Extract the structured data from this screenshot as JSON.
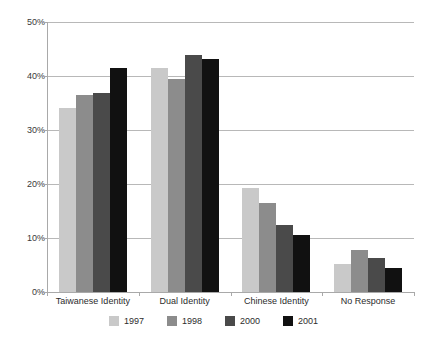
{
  "chart_data": {
    "type": "bar",
    "title": "",
    "subtitle": "",
    "xlabel": "",
    "ylabel": "",
    "ylim": [
      0,
      50
    ],
    "ytick_labels": [
      "50%",
      "40%",
      "30%",
      "20%",
      "10%",
      "0%"
    ],
    "ytick_values": [
      50,
      40,
      30,
      20,
      10,
      0
    ],
    "grid": true,
    "legend_position": "bottom",
    "categories": [
      "Taiwanese Identity",
      "Dual Identity",
      "Chinese Identity",
      "No Response"
    ],
    "series": [
      {
        "name": "1997",
        "color": "#c9c9c9",
        "values": [
          34.1,
          41.4,
          19.2,
          5.2
        ]
      },
      {
        "name": "1998",
        "color": "#8c8c8c",
        "values": [
          36.4,
          39.5,
          16.4,
          7.7
        ]
      },
      {
        "name": "2000",
        "color": "#4a4a4a",
        "values": [
          36.9,
          43.8,
          12.5,
          6.3
        ]
      },
      {
        "name": "2001",
        "color": "#111111",
        "values": [
          41.4,
          43.1,
          10.6,
          4.5
        ]
      }
    ]
  },
  "colors": {
    "gridline": "#b8b8b8",
    "axis": "#a9a9a9",
    "text": "#2c2c2c",
    "background": "#ffffff"
  }
}
